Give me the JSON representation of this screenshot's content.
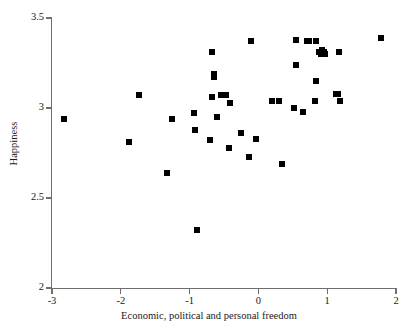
{
  "chart_data": {
    "type": "scatter",
    "title": "",
    "xlabel": "Economic, political and personal freedom",
    "ylabel": "Happiness",
    "xlim": [
      -3,
      2
    ],
    "ylim": [
      2,
      3.5
    ],
    "xticks": [
      -3,
      -2,
      -1,
      0,
      1,
      2
    ],
    "xtick_labels": [
      "-3",
      "-2",
      "-1",
      "0",
      "1",
      "2"
    ],
    "yticks": [
      2,
      2.5,
      3,
      3.5
    ],
    "ytick_labels": [
      "2",
      "2.5",
      "3",
      "3.5"
    ],
    "grid": false,
    "legend": null,
    "marker": "square",
    "marker_color": "#000000",
    "marker_size_px": 6,
    "n_points": 44,
    "points": [
      {
        "x": -2.83,
        "y": 2.94
      },
      {
        "x": -1.88,
        "y": 2.81
      },
      {
        "x": -1.73,
        "y": 3.07
      },
      {
        "x": -1.33,
        "y": 2.64
      },
      {
        "x": -1.25,
        "y": 2.94
      },
      {
        "x": -0.92,
        "y": 2.88
      },
      {
        "x": -0.93,
        "y": 2.97
      },
      {
        "x": -0.89,
        "y": 2.32
      },
      {
        "x": -0.7,
        "y": 2.82
      },
      {
        "x": -0.68,
        "y": 3.06
      },
      {
        "x": -0.67,
        "y": 3.31
      },
      {
        "x": -0.64,
        "y": 3.19
      },
      {
        "x": -0.64,
        "y": 3.17
      },
      {
        "x": -0.6,
        "y": 2.95
      },
      {
        "x": -0.47,
        "y": 3.07
      },
      {
        "x": -0.42,
        "y": 3.03
      },
      {
        "x": -0.43,
        "y": 2.78
      },
      {
        "x": -0.26,
        "y": 2.86
      },
      {
        "x": -0.13,
        "y": 2.73
      },
      {
        "x": -0.11,
        "y": 3.37
      },
      {
        "x": -0.03,
        "y": 2.83
      },
      {
        "x": 0.2,
        "y": 3.04
      },
      {
        "x": 0.35,
        "y": 2.69
      },
      {
        "x": 0.52,
        "y": 3.0
      },
      {
        "x": 0.54,
        "y": 3.38
      },
      {
        "x": 0.55,
        "y": 3.24
      },
      {
        "x": 0.65,
        "y": 2.98
      },
      {
        "x": 0.7,
        "y": 3.37
      },
      {
        "x": 0.82,
        "y": 3.04
      },
      {
        "x": 0.83,
        "y": 3.37
      },
      {
        "x": 0.84,
        "y": 3.15
      },
      {
        "x": 0.91,
        "y": 3.3
      },
      {
        "x": 0.93,
        "y": 3.32
      },
      {
        "x": 0.97,
        "y": 3.3
      },
      {
        "x": 1.13,
        "y": 3.08
      },
      {
        "x": 1.17,
        "y": 3.31
      },
      {
        "x": 1.19,
        "y": 3.04
      },
      {
        "x": 1.78,
        "y": 3.39
      },
      {
        "x": -0.55,
        "y": 3.07
      },
      {
        "x": 0.3,
        "y": 3.04
      },
      {
        "x": 0.74,
        "y": 3.37
      },
      {
        "x": 0.88,
        "y": 3.31
      },
      {
        "x": 1.15,
        "y": 3.08
      },
      {
        "x": 0.95,
        "y": 3.31
      }
    ]
  }
}
